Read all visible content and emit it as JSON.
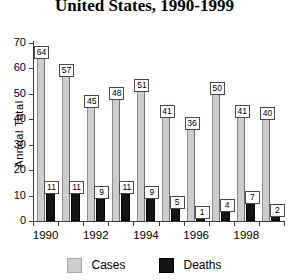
{
  "chart_data": {
    "type": "bar",
    "title": "United States, 1990-1999",
    "xlabel": "",
    "ylabel": "Annual Total",
    "ylim": [
      0,
      70
    ],
    "ytick_step": 10,
    "yticks": [
      "70",
      "60",
      "50",
      "40",
      "30",
      "20",
      "10",
      "0"
    ],
    "categories": [
      "1990",
      "1991",
      "1992",
      "1993",
      "1994",
      "1995",
      "1996",
      "1997",
      "1998",
      "1999"
    ],
    "xtick_labels_shown": [
      "1990",
      "1992",
      "1994",
      "1996",
      "1998"
    ],
    "grid": false,
    "legend_position": "bottom",
    "series": [
      {
        "name": "Cases",
        "color": "#cdcdcd",
        "values": [
          64,
          57,
          45,
          48,
          51,
          41,
          36,
          50,
          41,
          40
        ]
      },
      {
        "name": "Deaths",
        "color": "#141414",
        "values": [
          11,
          11,
          9,
          11,
          9,
          5,
          1,
          4,
          7,
          2
        ]
      }
    ],
    "data_labels": {
      "cases": [
        "64",
        "57",
        "45",
        "48",
        "51",
        "41",
        "36",
        "50",
        "41",
        "40"
      ],
      "deaths": [
        "11",
        "11",
        "9",
        "11",
        "9",
        "5",
        "1",
        "4",
        "7",
        "2"
      ]
    }
  },
  "legend": {
    "items": [
      {
        "label": "Cases",
        "color": "#cdcdcd"
      },
      {
        "label": "Deaths",
        "color": "#141414"
      }
    ]
  }
}
